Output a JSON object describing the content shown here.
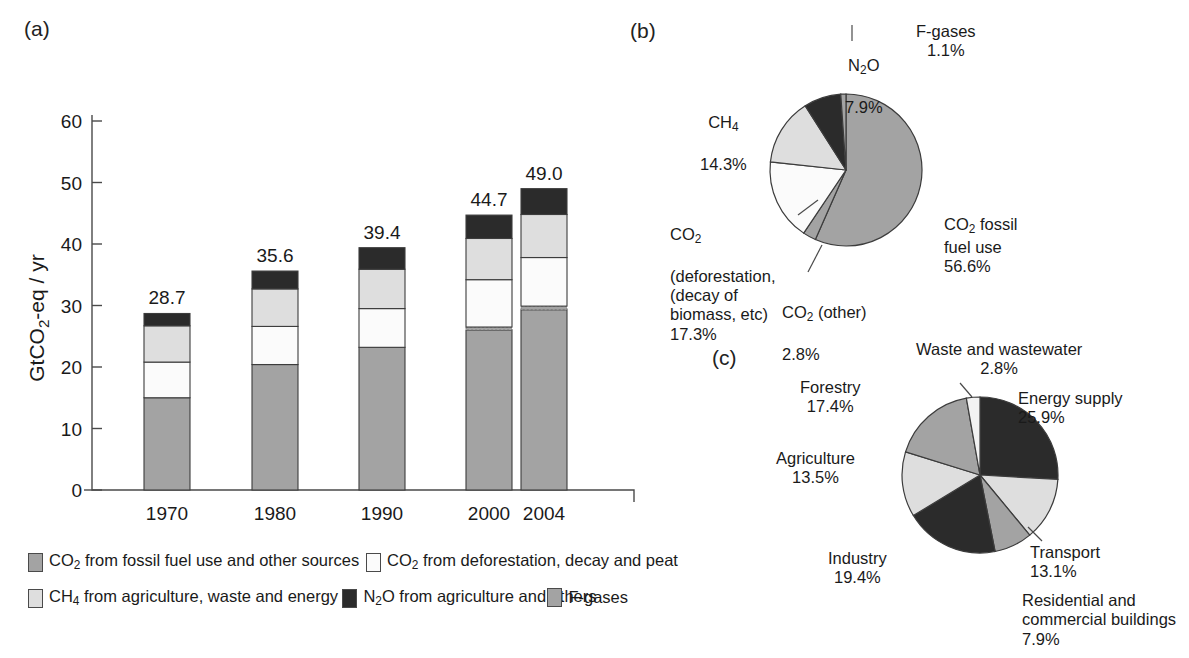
{
  "panels": {
    "a": "(a)",
    "b": "(b)",
    "c": "(c)"
  },
  "chart_data": [
    {
      "id": "stacked-bar-emissions",
      "type": "bar",
      "stacked": true,
      "title": "",
      "xlabel": "",
      "ylabel": "GtCO2-eq / yr",
      "ylabel_parts": {
        "pre": "GtCO",
        "sub": "2",
        "post": "-eq / yr"
      },
      "ylim": [
        0,
        60
      ],
      "yticks": [
        "0",
        "10",
        "20",
        "30",
        "40",
        "50",
        "60"
      ],
      "grid": false,
      "legend_position": "below",
      "categories": [
        "1970",
        "1980",
        "1990",
        "2000",
        "2004"
      ],
      "totals": [
        "28.7",
        "35.6",
        "39.4",
        "44.7",
        "49.0"
      ],
      "series": [
        {
          "name": "CO2 from fossil fuel use and other sources",
          "color": "#a3a3a3",
          "values": [
            15.0,
            20.4,
            23.2,
            26.0,
            29.3
          ]
        },
        {
          "name": "F-gases",
          "color": "#a3a3a3",
          "values": [
            0.0,
            0.0,
            0.0,
            0.5,
            0.6
          ]
        },
        {
          "name": "CO2 from deforestation, decay and peat",
          "color": "#fbfbfb",
          "values": [
            5.8,
            6.2,
            6.3,
            7.7,
            7.9
          ]
        },
        {
          "name": "CH4 from agriculture, waste and energy",
          "color": "#dedede",
          "values": [
            5.9,
            6.1,
            6.4,
            6.7,
            7.0
          ]
        },
        {
          "name": "N2O from agriculture and others",
          "color": "#2b2b2b",
          "values": [
            2.0,
            2.9,
            3.5,
            3.8,
            4.2
          ]
        }
      ]
    },
    {
      "id": "pie-ghg-by-gas",
      "type": "pie",
      "title": "",
      "legend_position": "callout",
      "labels": [
        "CO2 fossil fuel use",
        "CO2 (other)",
        "CO2 (deforestation, (decay of biomass, etc)",
        "CH4",
        "N2O",
        "F-gases"
      ],
      "values": [
        56.6,
        2.8,
        17.3,
        14.3,
        7.9,
        1.1
      ],
      "value_labels": [
        "56.6%",
        "2.8%",
        "17.3%",
        "14.3%",
        "7.9%",
        "1.1%"
      ],
      "colors": [
        "#a3a3a3",
        "#a3a3a3",
        "#fbfbfb",
        "#dedede",
        "#2b2b2b",
        "#a3a3a3"
      ]
    },
    {
      "id": "pie-ghg-by-sector",
      "type": "pie",
      "title": "",
      "legend_position": "callout",
      "labels": [
        "Energy supply",
        "Transport",
        "Residential and commercial buildings",
        "Industry",
        "Agriculture",
        "Forestry",
        "Waste and wastewater"
      ],
      "values": [
        25.9,
        13.1,
        7.9,
        19.4,
        13.5,
        17.4,
        2.8
      ],
      "value_labels": [
        "25.9%",
        "13.1%",
        "7.9%",
        "19.4%",
        "13.5%",
        "17.4%",
        "2.8%"
      ],
      "colors": [
        "#2b2b2b",
        "#dedede",
        "#a3a3a3",
        "#2b2b2b",
        "#dedede",
        "#a3a3a3",
        "#f2f2f2"
      ]
    }
  ],
  "legend": {
    "items": [
      {
        "swatch": "#a3a3a3",
        "pre": "CO",
        "sub": "2",
        "post": " from fossil fuel use and other sources"
      },
      {
        "swatch": "#fbfbfb",
        "pre": "CO",
        "sub": "2",
        "post": " from deforestation, decay and peat"
      },
      {
        "swatch": "#dedede",
        "pre": "CH",
        "sub": "4",
        "post": " from agriculture, waste and energy"
      },
      {
        "swatch": "#2b2b2b",
        "pre": "N",
        "sub": "2",
        "post": "O from agriculture and others"
      },
      {
        "swatch": "#a3a3a3",
        "pre": "F-gases",
        "sub": "",
        "post": ""
      }
    ]
  },
  "pie_b_labels": {
    "fgases": "F-gases\n1.1%",
    "n2o_pre": "N",
    "n2o_sub": "2",
    "n2o_post": "O",
    "n2o_pct": "7.9%",
    "ch4_pre": "CH",
    "ch4_sub": "4",
    "ch4_pct": "14.3%",
    "defor_pre": "CO",
    "defor_sub": "2",
    "defor_rest": "(deforestation,\n(decay of\nbiomass, etc)\n17.3%",
    "other_pre": "CO",
    "other_sub": "2",
    "other_post": " (other)",
    "other_pct": "2.8%",
    "fossil_pre": "CO",
    "fossil_sub": "2",
    "fossil_post": " fossil\nfuel use\n56.6%"
  },
  "pie_c_labels": {
    "waste": "Waste and wastewater\n2.8%",
    "forestry": "Forestry\n17.4%",
    "agriculture": "Agriculture\n13.5%",
    "industry": "Industry\n19.4%",
    "residential": "Residential and\ncommercial buildings\n7.9%",
    "transport": "Transport\n13.1%",
    "energy": "Energy supply\n25.9%"
  },
  "colors": {
    "gray_fossil": "#a3a3a3",
    "white_defor": "#fbfbfb",
    "light_ch4": "#dedede",
    "dark_n2o": "#2b2b2b",
    "outline": "#3c3c3c",
    "axis": "#4a4a4a"
  }
}
